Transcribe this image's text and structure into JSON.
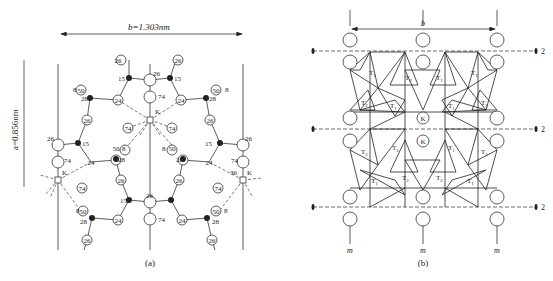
{
  "panel_a": {
    "caption": "(a)",
    "b_dimension": "b=1.303nm",
    "a_dimension": "a=0.856nm",
    "cation": "K",
    "labels": {
      "n26": "26",
      "n15": "15",
      "n24": "24",
      "n74": "74",
      "n28": "28",
      "n50": "50",
      "n8": "8",
      "n36": "36"
    }
  },
  "panel_b": {
    "caption": "(b)",
    "b_dimension": "b",
    "cation": "K",
    "tetrahedra": {
      "t1": "T",
      "t1_sub": "1",
      "t2": "T",
      "t2_sub": "2"
    },
    "twofold_axis": "2",
    "mirror": "m"
  }
}
